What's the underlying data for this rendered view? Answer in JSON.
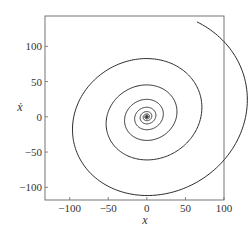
{
  "chart_data": {
    "type": "line",
    "title": "",
    "xlabel": "x",
    "ylabel": "ẋ",
    "xlim": [
      -132,
      100
    ],
    "ylim": [
      -118,
      143
    ],
    "xticks": [
      -100,
      -50,
      0,
      50,
      100
    ],
    "xtick_labels": [
      "−100",
      "−50",
      "0",
      "50",
      "100"
    ],
    "yticks": [
      -100,
      -50,
      0,
      50,
      100
    ],
    "ytick_labels": [
      "−100",
      "−50",
      "0",
      "50",
      "100"
    ],
    "grid": false,
    "legend": null,
    "series": [
      {
        "name": "phase trajectory",
        "description": "Damped oscillator phase-plane spiral, clockwise, converging to origin",
        "x": [
          -36,
          -80,
          -110,
          -126,
          -128,
          -118,
          -95,
          -60,
          -12,
          40,
          80,
          95,
          85,
          55,
          10,
          -35,
          -60,
          -65,
          -55,
          -25,
          10,
          40,
          53,
          45,
          20,
          -10,
          -30,
          -35,
          -25,
          0,
          20,
          27,
          20,
          0,
          -18,
          -22,
          -15,
          0,
          12,
          15,
          8,
          0,
          -8,
          -9,
          -4,
          0,
          4,
          5,
          2,
          0
        ],
        "y": [
          136,
          110,
          70,
          25,
          0,
          -40,
          -75,
          -100,
          -112,
          -100,
          -60,
          0,
          45,
          72,
          81,
          70,
          40,
          0,
          -35,
          -58,
          -62,
          -45,
          0,
          32,
          50,
          55,
          40,
          0,
          -28,
          -40,
          -35,
          -15,
          18,
          28,
          22,
          0,
          -18,
          -25,
          -15,
          0,
          13,
          16,
          8,
          0,
          -9,
          -10,
          -3,
          0,
          5,
          0
        ]
      }
    ],
    "spiral_model": {
      "start": {
        "x": -36,
        "y": 136
      },
      "decay_per_half_turn": 0.74,
      "x_amplitude_start": 128,
      "y_amplitude_start": 136,
      "y_extrema_x_offset": 12,
      "direction": "clockwise",
      "half_turns": 18
    }
  },
  "colors": {
    "line": "#2a2a2a",
    "axis": "#555555",
    "text": "#333333",
    "background": "#ffffff"
  }
}
